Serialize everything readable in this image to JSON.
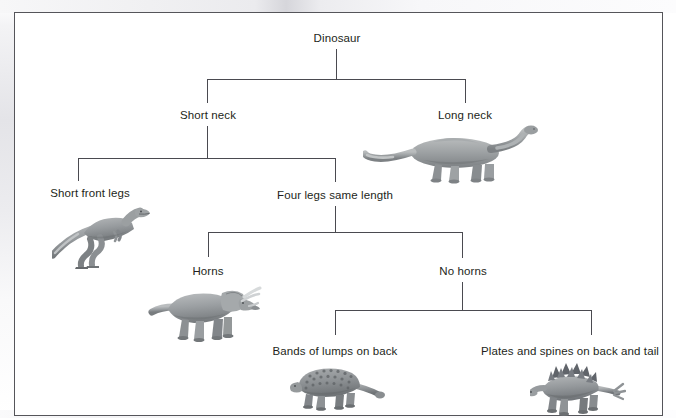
{
  "diagram": {
    "type": "dichotomous-key-tree",
    "frame": {
      "border_color": "#55555a",
      "background": "#ffffff"
    },
    "nodes": [
      {
        "id": "dinosaur",
        "label": "Dinosaur",
        "level": 0,
        "x": 337,
        "y": 38,
        "has_image": false
      },
      {
        "id": "short-neck",
        "label": "Short neck",
        "level": 1,
        "x": 208,
        "y": 115,
        "has_image": false
      },
      {
        "id": "long-neck",
        "label": "Long neck",
        "level": 1,
        "x": 465,
        "y": 115,
        "has_image": true,
        "image": "sauropod-dinosaur"
      },
      {
        "id": "short-front-legs",
        "label": "Short front legs",
        "level": 2,
        "x": 90,
        "y": 193,
        "has_image": true,
        "image": "theropod-dinosaur"
      },
      {
        "id": "four-legs",
        "label": "Four legs same length",
        "level": 2,
        "x": 335,
        "y": 195,
        "has_image": false
      },
      {
        "id": "horns",
        "label": "Horns",
        "level": 3,
        "x": 208,
        "y": 271,
        "has_image": true,
        "image": "triceratops-dinosaur"
      },
      {
        "id": "no-horns",
        "label": "No horns",
        "level": 3,
        "x": 463,
        "y": 271,
        "has_image": false
      },
      {
        "id": "bands-lumps",
        "label": "Bands of lumps on back",
        "level": 4,
        "x": 335,
        "y": 351,
        "has_image": true,
        "image": "ankylosaurus-dinosaur"
      },
      {
        "id": "plates-spines",
        "label": "Plates and spines on back and tail",
        "level": 4,
        "x": 570,
        "y": 351,
        "has_image": true,
        "image": "stegosaurus-dinosaur"
      }
    ],
    "edges": [
      {
        "from": "dinosaur",
        "to": [
          "short-neck",
          "long-neck"
        ]
      },
      {
        "from": "short-neck",
        "to": [
          "short-front-legs",
          "four-legs"
        ]
      },
      {
        "from": "four-legs",
        "to": [
          "horns",
          "no-horns"
        ]
      },
      {
        "from": "no-horns",
        "to": [
          "bands-lumps",
          "plates-spines"
        ]
      }
    ],
    "line_color": "#4a4a50",
    "text_color": "#231f20"
  }
}
